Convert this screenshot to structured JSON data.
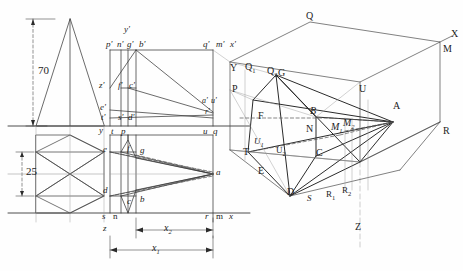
{
  "drawing": {
    "title": "Descriptive geometry construction: orthographic projections and axonometric view",
    "background": "#fefefe",
    "line_color": "#2b2b2b",
    "thin_line_color": "#6b6b6b",
    "dash_color": "#555555"
  },
  "dimensions": {
    "height_70": "70",
    "height_25": "25",
    "x1": "x",
    "x1_sub": "1",
    "x2": "x",
    "x2_sub": "2"
  },
  "front_view_labels": {
    "y_prime": "y'",
    "p_prime": "p'",
    "n_prime": "n'",
    "g_prime": "g'",
    "b_prime": "b'",
    "q_prime": "q'",
    "m_prime": "m'",
    "x_prime": "x'",
    "z_prime": "z'",
    "f_prime": "f'",
    "c_prime": "c'",
    "e_prime": "e'",
    "t_prime": "t'",
    "s_prime": "s'",
    "d_prime": "d'",
    "a_prime": "a'",
    "u_prime": "u'",
    "r_prime": "r'"
  },
  "top_view_labels": {
    "y": "y",
    "t": "t",
    "p": "p",
    "u": "u",
    "q": "q",
    "e": "e",
    "f": "f",
    "g": "g",
    "a": "a",
    "d": "d",
    "c": "c",
    "b": "b",
    "s": "s",
    "n": "n",
    "z": "z",
    "r": "r",
    "m": "m",
    "x": "x"
  },
  "axonometric_labels": {
    "Q": "Q",
    "X": "X",
    "M": "M",
    "Y": "Y",
    "Q1": "Q",
    "Q1_sub": "1",
    "Q2": "Q",
    "Q2_sub": "2",
    "G": "G",
    "P": "P",
    "U": "U",
    "A": "A",
    "F": "F",
    "B": "B",
    "R": "R",
    "N": "N",
    "M1": "M",
    "M1_sub": "1",
    "M2": "M",
    "M2_sub": "2",
    "U1": "U",
    "U1_sub": "1",
    "U2": "U",
    "U2_sub": "2",
    "T": "T",
    "C": "C",
    "E": "E",
    "D": "D",
    "S": "S",
    "R1": "R",
    "R1_sub": "1",
    "R2": "R",
    "R2_sub": "2",
    "Z": "Z"
  }
}
